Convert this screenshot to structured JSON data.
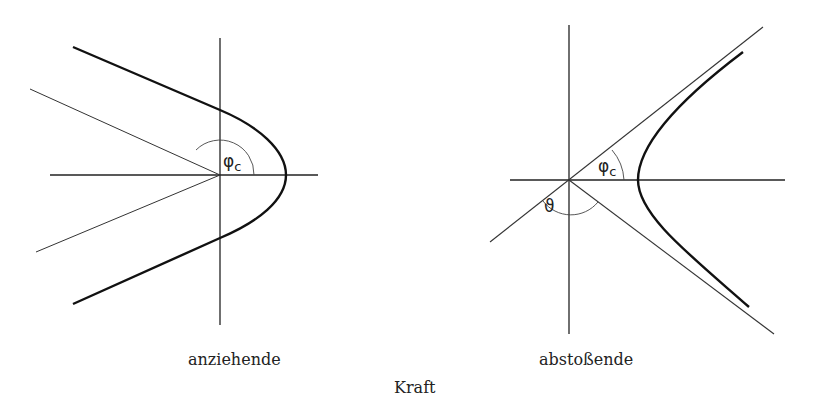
{
  "figure": {
    "panels": [
      {
        "id": "attractive",
        "caption": "anziehende",
        "curve": "parabola",
        "angle_labels": [
          {
            "symbol": "φ",
            "subscript": "c"
          }
        ]
      },
      {
        "id": "repulsive",
        "caption": "abstoßende",
        "curve": "hyperbola",
        "angle_labels": [
          {
            "symbol": "φ",
            "subscript": "c"
          },
          {
            "symbol": "ϑ",
            "subscript": ""
          }
        ]
      }
    ],
    "shared_caption": "Kraft"
  },
  "colors": {
    "ink": "#222222",
    "background": "#ffffff"
  }
}
